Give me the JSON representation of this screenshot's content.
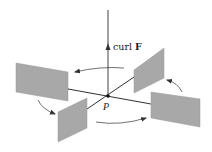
{
  "figure": {
    "axis_label_prefix": "curl ",
    "axis_label_vector": "F",
    "point_label": "P",
    "colors": {
      "line": "#1a1a1a",
      "vane_fill": "#a8a8a8",
      "vane_edge": "#9a9a9a",
      "arrow": "#333333",
      "background": "#ffffff"
    },
    "vanes": [
      {
        "id": "left",
        "position": "back-left"
      },
      {
        "id": "right-back",
        "position": "back-right"
      },
      {
        "id": "front-left",
        "position": "front-left"
      },
      {
        "id": "right-front",
        "position": "front-right"
      }
    ],
    "rotation_arrows": [
      {
        "id": "top",
        "direction": "counterclockwise"
      },
      {
        "id": "left",
        "direction": "counterclockwise"
      },
      {
        "id": "bottom",
        "direction": "counterclockwise"
      },
      {
        "id": "right",
        "direction": "counterclockwise"
      }
    ]
  }
}
